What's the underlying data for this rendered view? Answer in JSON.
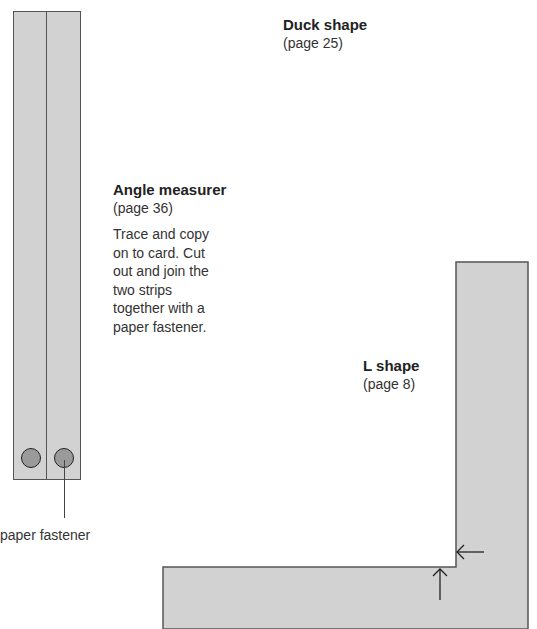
{
  "duck": {
    "title": "Duck shape",
    "page": "(page 25)"
  },
  "angle": {
    "title": "Angle measurer",
    "page": "(page 36)",
    "lines": [
      "Trace and copy",
      "on to card. Cut",
      "out and join the",
      "two strips",
      "together with a",
      "paper fastener."
    ]
  },
  "lshape": {
    "title": "L shape",
    "page": "(page 8)"
  },
  "fastener_label": "paper fastener",
  "colors": {
    "card": "#d2d2d2",
    "outline": "#555555",
    "hole": "#9a9a9a"
  }
}
